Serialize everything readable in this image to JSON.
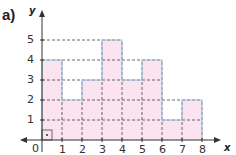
{
  "part_label": "a)",
  "chart_data": {
    "type": "bar",
    "subtype": "histogram-step",
    "title": "",
    "xlabel": "x",
    "ylabel": "y",
    "categories": [
      "0-1",
      "1-2",
      "2-3",
      "3-4",
      "4-5",
      "5-6",
      "6-7",
      "7-8"
    ],
    "x_edges": [
      0,
      1,
      2,
      3,
      4,
      5,
      6,
      7,
      8
    ],
    "values": [
      4,
      2,
      3,
      5,
      3,
      4,
      1,
      2
    ],
    "xlim": [
      0,
      8
    ],
    "ylim": [
      0,
      5
    ],
    "x_ticks": [
      "1",
      "2",
      "3",
      "4",
      "5",
      "6",
      "7",
      "8"
    ],
    "y_ticks": [
      "1",
      "2",
      "3",
      "4",
      "5"
    ],
    "origin_label": "0",
    "grid": "dashed",
    "legend": null,
    "colors": {
      "fill": "#fbe3ef",
      "edge": "#9fbfe0",
      "grid": "#444444",
      "axis": "#333333"
    }
  }
}
